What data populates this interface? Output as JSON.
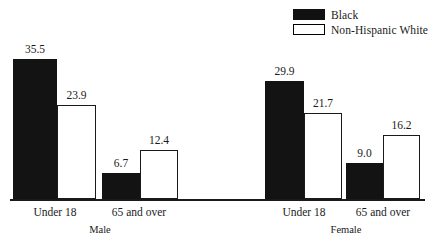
{
  "chart_data": {
    "type": "bar",
    "title": "",
    "subtitle": "",
    "xlabel": "",
    "ylabel": "",
    "grid": false,
    "ylim": [
      0,
      36
    ],
    "legend_position": "top-right",
    "categories": [
      "Under 18",
      "65 and over",
      "Under 18",
      "65 and over"
    ],
    "groups": [
      {
        "name": "Male",
        "categories": [
          "Under 18",
          "65 and over"
        ]
      },
      {
        "name": "Female",
        "categories": [
          "Under 18",
          "65 and over"
        ]
      }
    ],
    "series": [
      {
        "name": "Black",
        "color": "#131313",
        "values": [
          35.5,
          6.7,
          29.9,
          9.0
        ]
      },
      {
        "name": "Non-Hispanic White",
        "color": "#ffffff",
        "values": [
          23.9,
          12.4,
          21.7,
          16.2
        ]
      }
    ],
    "bars": [
      {
        "group": "Male",
        "category": "Under 18",
        "series": "Black",
        "value": 35.5,
        "label": "35.5",
        "style": "black",
        "x": 13,
        "width": 44
      },
      {
        "group": "Male",
        "category": "Under 18",
        "series": "Non-Hispanic White",
        "value": 23.9,
        "label": "23.9",
        "style": "white",
        "x": 57,
        "width": 39
      },
      {
        "group": "Male",
        "category": "65 and over",
        "series": "Black",
        "value": 6.7,
        "label": "6.7",
        "style": "black",
        "x": 102,
        "width": 38
      },
      {
        "group": "Male",
        "category": "65 and over",
        "series": "Non-Hispanic White",
        "value": 12.4,
        "label": "12.4",
        "style": "white",
        "x": 140,
        "width": 38
      },
      {
        "group": "Female",
        "category": "Under 18",
        "series": "Black",
        "value": 29.9,
        "label": "29.9",
        "style": "black",
        "x": 265,
        "width": 39
      },
      {
        "group": "Female",
        "category": "Under 18",
        "series": "Non-Hispanic White",
        "value": 21.7,
        "label": "21.7",
        "style": "white",
        "x": 304,
        "width": 38
      },
      {
        "group": "Female",
        "category": "65 and over",
        "series": "Black",
        "value": 9.0,
        "label": "9.0",
        "style": "black",
        "x": 346,
        "width": 37
      },
      {
        "group": "Female",
        "category": "65 and over",
        "series": "Non-Hispanic White",
        "value": 16.2,
        "label": "16.2",
        "style": "white",
        "x": 383,
        "width": 37
      }
    ],
    "category_labels": [
      {
        "text": "Under 18",
        "x": 55
      },
      {
        "text": "65 and over",
        "x": 139
      },
      {
        "text": "Under 18",
        "x": 304
      },
      {
        "text": "65 and over",
        "x": 383
      }
    ],
    "group_labels": [
      {
        "text": "Male",
        "x": 100
      },
      {
        "text": "Female",
        "x": 346
      }
    ]
  },
  "legend": {
    "items": [
      {
        "label": "Black",
        "swatch": "filled"
      },
      {
        "label": "Non-Hispanic White",
        "swatch": "hollow"
      }
    ]
  },
  "axis": {
    "baseline_y": 199,
    "scale_px_per_unit": 3.95
  }
}
